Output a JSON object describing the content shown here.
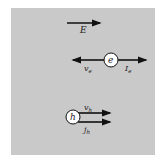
{
  "diagram": {
    "background_color": "#c9c9c9",
    "field": {
      "label": "E",
      "direction": "right"
    },
    "electron": {
      "symbol": "e",
      "velocity_label": "v",
      "velocity_sub": "e",
      "velocity_direction": "left",
      "current_label": "I",
      "current_sub": "e",
      "current_direction": "right"
    },
    "hole": {
      "symbol": "h",
      "velocity_label": "v",
      "velocity_sub": "h",
      "velocity_direction": "right",
      "current_label": "j",
      "current_sub": "h",
      "current_direction": "right"
    }
  }
}
